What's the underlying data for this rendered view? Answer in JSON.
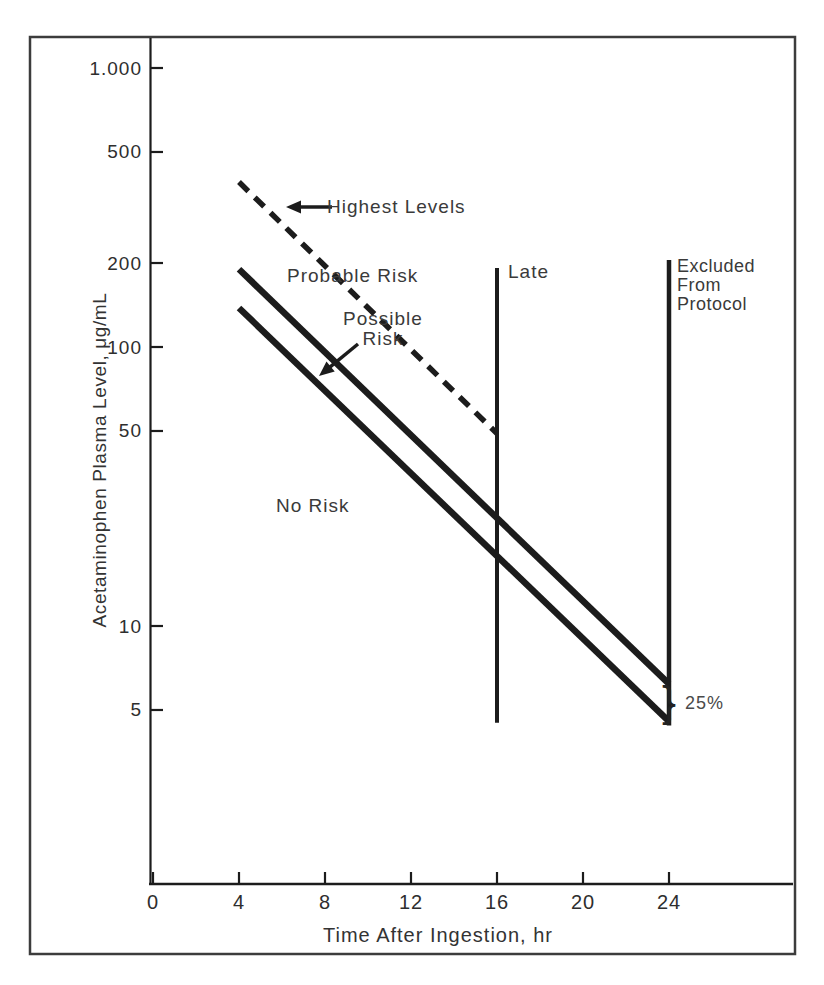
{
  "figure": {
    "background": "#ffffff",
    "frame_color": "#3c3c3c",
    "line_color": "#1c1c1c",
    "text_color": "#3a3a3a"
  },
  "chart_data": {
    "type": "line",
    "scale": "semilog-y",
    "xlabel": "Time After Ingestion, hr",
    "ylabel": "Acetaminophen Plasma Level, μg/mL",
    "x_axis": {
      "min": 0,
      "max": 29.8,
      "ticks": [
        0,
        4,
        8,
        12,
        16,
        20,
        24
      ],
      "tick_labels": [
        "0",
        "4",
        "8",
        "12",
        "16",
        "20",
        "24"
      ]
    },
    "y_axis": {
      "scale": "log",
      "min": 1.2,
      "max": 1250,
      "ticks": [
        1000,
        500,
        200,
        100,
        50,
        10,
        5
      ],
      "tick_labels": [
        "1.000",
        "500",
        "200",
        "100",
        "50",
        "10",
        "5"
      ]
    },
    "series": [
      {
        "name": "highest-levels-line",
        "style": "dashed",
        "width": 5.5,
        "points": [
          [
            4,
            390
          ],
          [
            16,
            49
          ]
        ]
      },
      {
        "name": "probable-risk-line",
        "style": "solid",
        "width": 6.5,
        "points": [
          [
            4,
            190
          ],
          [
            24,
            6.2
          ]
        ]
      },
      {
        "name": "possible-risk-line",
        "style": "solid",
        "width": 6.5,
        "points": [
          [
            4,
            138
          ],
          [
            24,
            4.55
          ]
        ]
      },
      {
        "name": "late-boundary-line",
        "style": "solid",
        "width": 4,
        "points": [
          [
            16,
            192
          ],
          [
            16,
            4.5
          ]
        ]
      },
      {
        "name": "excluded-boundary-line",
        "style": "solid",
        "width": 4.5,
        "points": [
          [
            24,
            205
          ],
          [
            24,
            4.4
          ]
        ]
      }
    ],
    "annotations": {
      "highest_levels": "Highest Levels",
      "probable_risk": "Probable Risk",
      "possible_risk": "Possible Risk",
      "no_risk": "No Risk",
      "late": "Late",
      "excluded": "Excluded From Protocol",
      "difference": "25%",
      "brace": "}"
    },
    "legend": "none",
    "grid": false
  }
}
